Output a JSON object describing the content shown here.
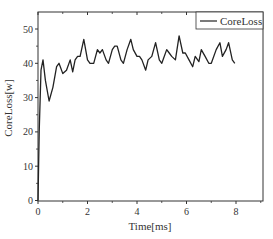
{
  "chart_data": {
    "type": "line",
    "title": "",
    "xlabel": "Time[ms]",
    "ylabel": "CoreLoss[w]",
    "xlim": [
      0,
      9.1
    ],
    "ylim": [
      0,
      55
    ],
    "xticks": [
      0,
      2,
      4,
      6,
      8
    ],
    "xtick_labels": [
      "0",
      "2",
      "4",
      "6",
      "8"
    ],
    "yticks": [
      0,
      10,
      20,
      30,
      40,
      50
    ],
    "ytick_labels": [
      "0",
      "10",
      "20",
      "30",
      "40",
      "50"
    ],
    "grid": false,
    "legend_position": "upper right",
    "line_color": "#222222",
    "series": [
      {
        "name": "CoreLoss",
        "x": [
          0,
          0.05,
          0.12,
          0.2,
          0.3,
          0.45,
          0.6,
          0.75,
          0.85,
          1.0,
          1.15,
          1.3,
          1.4,
          1.5,
          1.6,
          1.7,
          1.85,
          2.0,
          2.1,
          2.25,
          2.4,
          2.5,
          2.6,
          2.75,
          2.85,
          3.0,
          3.1,
          3.2,
          3.35,
          3.45,
          3.6,
          3.75,
          3.85,
          4.0,
          4.1,
          4.2,
          4.35,
          4.45,
          4.6,
          4.75,
          4.9,
          5.0,
          5.2,
          5.3,
          5.4,
          5.55,
          5.7,
          5.85,
          5.95,
          6.1,
          6.25,
          6.35,
          6.5,
          6.6,
          6.75,
          6.9,
          7.0,
          7.2,
          7.35,
          7.45,
          7.6,
          7.7,
          7.85,
          7.95
        ],
        "values": [
          0,
          20,
          38,
          41,
          35,
          29,
          33,
          39,
          40,
          37,
          38,
          41,
          37.5,
          41,
          42,
          42,
          47,
          41,
          40,
          40,
          44,
          43,
          44,
          41,
          40,
          44,
          45,
          45,
          41,
          40,
          44,
          47,
          44,
          42,
          42,
          41,
          38,
          41,
          42,
          46,
          41,
          40,
          44,
          43,
          42,
          41,
          48,
          43,
          43,
          41,
          39,
          42,
          40.5,
          44,
          42,
          40,
          40,
          44,
          46,
          42,
          44,
          46,
          41,
          40
        ]
      }
    ]
  },
  "legend": {
    "label": "CoreLoss"
  },
  "axes": {
    "xlabel": "Time[ms]",
    "ylabel": "CoreLoss[w]"
  }
}
